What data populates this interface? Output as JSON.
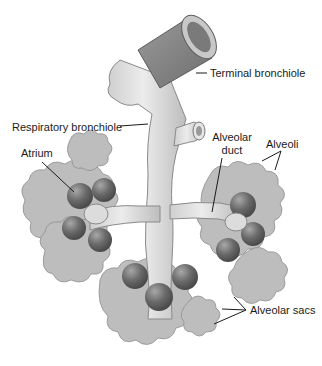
{
  "diagram": {
    "labels": {
      "terminal_bronchiole": "Terminal bronchiole",
      "respiratory_bronchiole": "Respiratory bronchiole",
      "atrium": "Atrium",
      "alveolar_duct_line1": "Alveolar",
      "alveolar_duct_line2": "duct",
      "alveoli": "Alveoli",
      "alveolar_sacs": "Alveolar sacs"
    },
    "colors": {
      "bronchiole_dark": "#7d7d7d",
      "bronchiole_light": "#d6d6d6",
      "alveoli_fill": "#b9b9b9",
      "sac_dark": "#5e5e5e",
      "line": "#1a1a1a",
      "background": "#ffffff"
    }
  }
}
